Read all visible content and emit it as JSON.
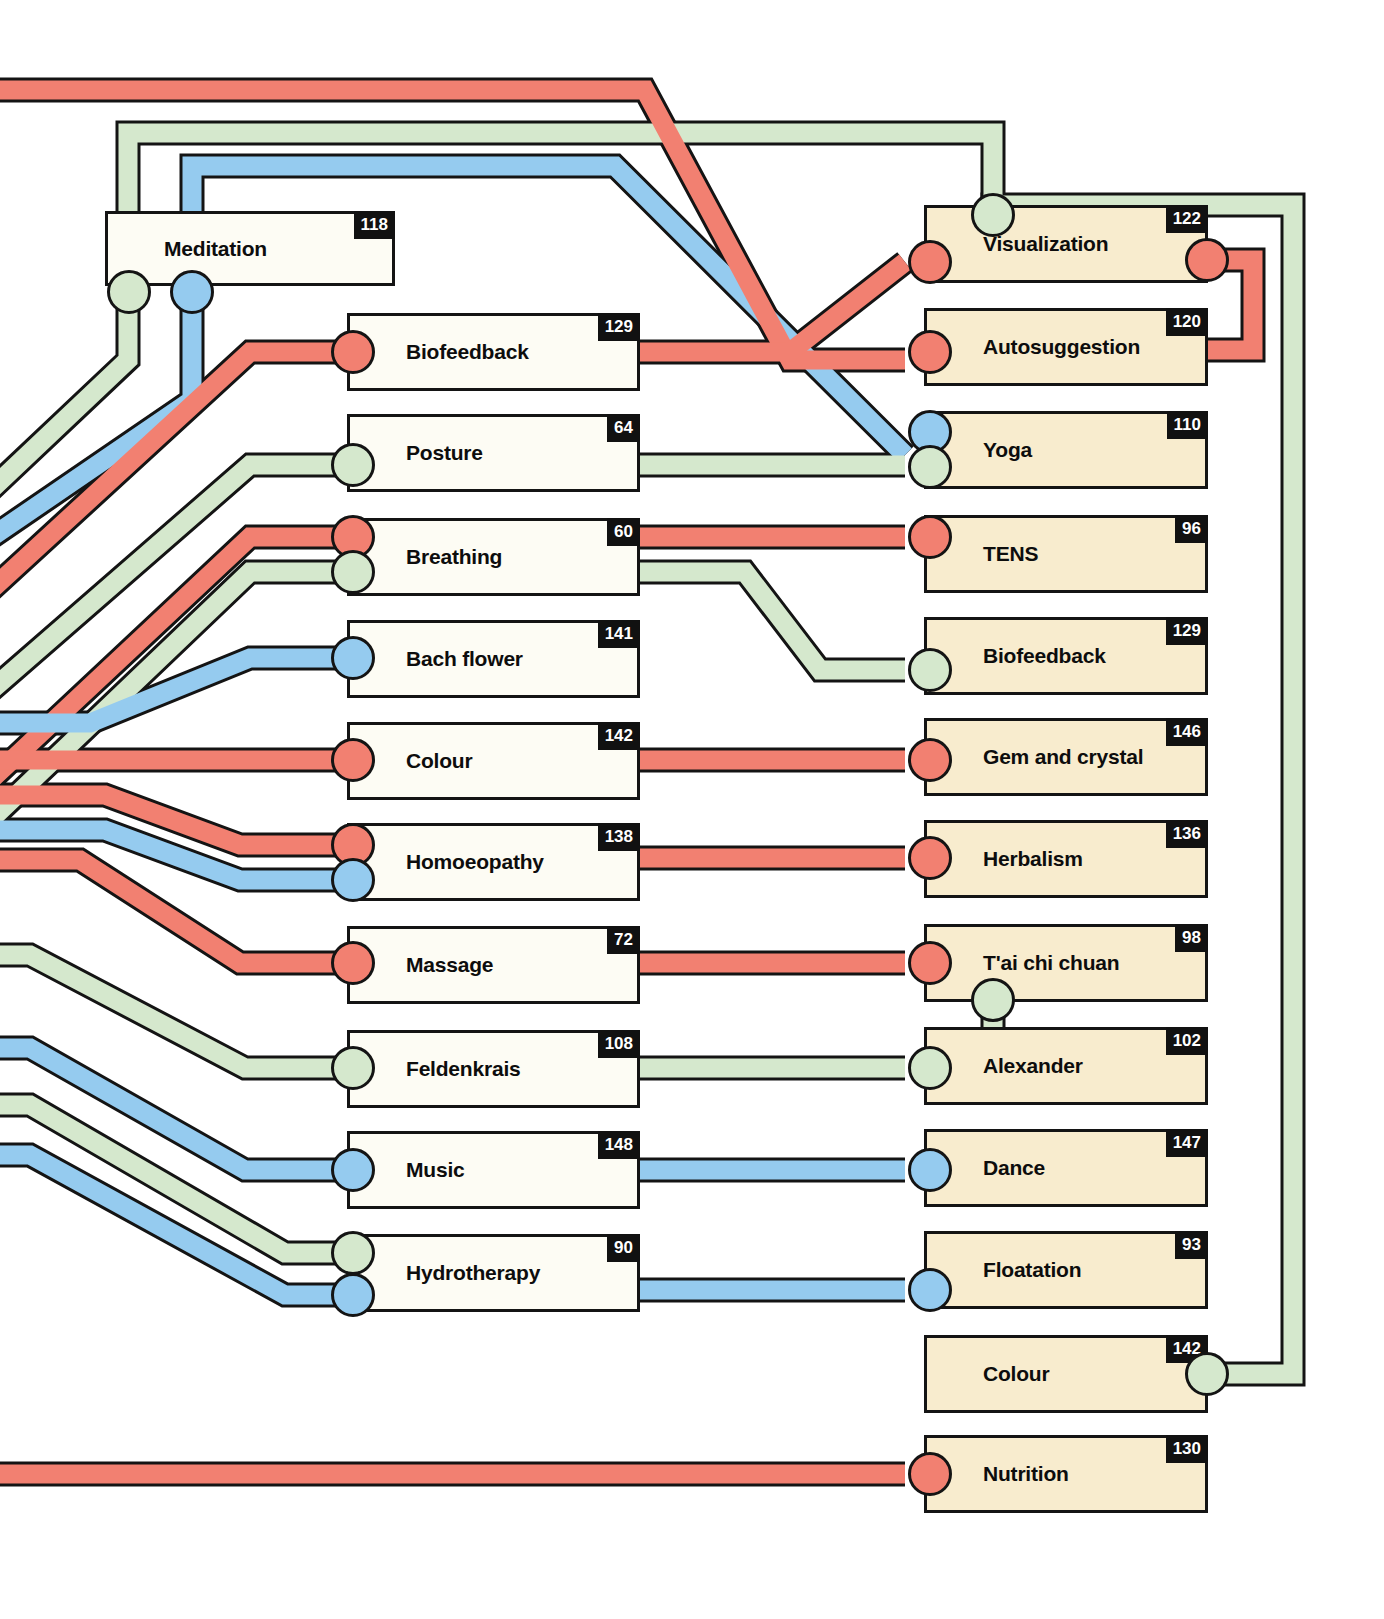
{
  "diagram": {
    "type": "network-linkage-chart",
    "palette": {
      "red": "#f28071",
      "blue": "#95cbef",
      "green": "#d5e8cd",
      "outline": "#141414",
      "box_left_fill": "#fdfcf4",
      "box_right_fill": "#f8ecce",
      "badge_bg": "#111111",
      "badge_text": "#ffffff",
      "page_bg": "#ffffff"
    },
    "left_column": [
      {
        "label": "Meditation",
        "badge": "118"
      },
      {
        "label": "Biofeedback",
        "badge": "129"
      },
      {
        "label": "Posture",
        "badge": "64"
      },
      {
        "label": "Breathing",
        "badge": "60"
      },
      {
        "label": "Bach flower",
        "badge": "141"
      },
      {
        "label": "Colour",
        "badge": "142"
      },
      {
        "label": "Homoeopathy",
        "badge": "138"
      },
      {
        "label": "Massage",
        "badge": "72"
      },
      {
        "label": "Feldenkrais",
        "badge": "108"
      },
      {
        "label": "Music",
        "badge": "148"
      },
      {
        "label": "Hydrotherapy",
        "badge": "90"
      }
    ],
    "right_column": [
      {
        "label": "Visualization",
        "badge": "122"
      },
      {
        "label": "Autosuggestion",
        "badge": "120"
      },
      {
        "label": "Yoga",
        "badge": "110"
      },
      {
        "label": "TENS",
        "badge": "96"
      },
      {
        "label": "Biofeedback",
        "badge": "129"
      },
      {
        "label": "Gem and crystal",
        "badge": "146"
      },
      {
        "label": "Herbalism",
        "badge": "136"
      },
      {
        "label": "T'ai chi chuan",
        "badge": "98"
      },
      {
        "label": "Alexander",
        "badge": "102"
      },
      {
        "label": "Dance",
        "badge": "147"
      },
      {
        "label": "Floatation",
        "badge": "93"
      },
      {
        "label": "Colour",
        "badge": "142"
      },
      {
        "label": "Nutrition",
        "badge": "130"
      }
    ]
  }
}
